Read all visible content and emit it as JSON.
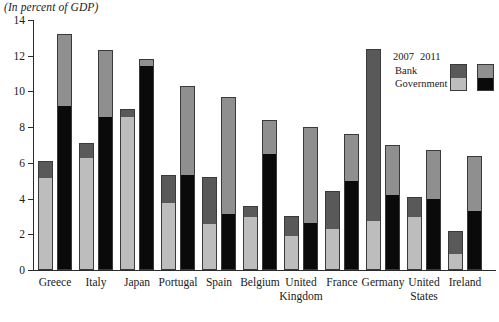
{
  "chart_data": {
    "type": "bar",
    "title": "(In percent of GDP)",
    "subtitle": "",
    "xlabel": "",
    "ylabel": "",
    "ylim": [
      0,
      14
    ],
    "yticks": [
      0,
      2,
      4,
      6,
      8,
      10,
      12,
      14
    ],
    "ytick_labels": [
      "0",
      "2",
      "4",
      "6",
      "8",
      "10",
      "12",
      "14"
    ],
    "grid": false,
    "stacked": true,
    "legend_position": "top-right",
    "legend": {
      "column_headers": [
        "2007",
        "2011"
      ],
      "row_labels": [
        "Bank",
        "Government"
      ]
    },
    "categories": [
      "Greece",
      "Italy",
      "Japan",
      "Portugal",
      "Spain",
      "Belgium",
      "United Kingdom",
      "France",
      "Germany",
      "United States",
      "Ireland"
    ],
    "category_label_lines": [
      [
        "Greece"
      ],
      [
        "Italy"
      ],
      [
        "Japan"
      ],
      [
        "Portugal"
      ],
      [
        "Spain"
      ],
      [
        "Belgium"
      ],
      [
        "United",
        "Kingdom"
      ],
      [
        "France"
      ],
      [
        "Germany"
      ],
      [
        "United",
        "States"
      ],
      [
        "Ireland"
      ]
    ],
    "series": [
      {
        "name": "Government 2007",
        "year": "2007",
        "component": "Government",
        "color": "#bdbdbd",
        "values": [
          5.2,
          6.3,
          8.6,
          3.8,
          2.6,
          3.0,
          1.9,
          2.3,
          2.7,
          3.0,
          0.9
        ]
      },
      {
        "name": "Bank 2007",
        "year": "2007",
        "component": "Bank",
        "color": "#595959",
        "values": [
          0.9,
          0.8,
          0.4,
          1.5,
          2.6,
          0.6,
          1.1,
          2.1,
          9.7,
          1.1,
          1.3
        ]
      },
      {
        "name": "Government 2011",
        "year": "2011",
        "component": "Government",
        "color": "#0a0a0a",
        "values": [
          9.2,
          8.6,
          11.5,
          5.3,
          3.1,
          6.5,
          2.6,
          5.0,
          4.2,
          4.0,
          3.3
        ]
      },
      {
        "name": "Bank 2011",
        "year": "2011",
        "component": "Bank",
        "color": "#8f8f8f",
        "values": [
          4.0,
          3.7,
          0.3,
          5.0,
          6.6,
          1.9,
          5.4,
          2.6,
          2.8,
          2.7,
          3.1
        ]
      }
    ],
    "totals_2007": [
      6.1,
      7.1,
      9.0,
      5.3,
      5.2,
      3.6,
      3.0,
      4.4,
      12.4,
      4.1,
      2.2
    ],
    "totals_2011": [
      13.2,
      12.3,
      11.8,
      10.3,
      9.7,
      8.4,
      8.0,
      7.6,
      7.0,
      6.7,
      6.4
    ]
  }
}
